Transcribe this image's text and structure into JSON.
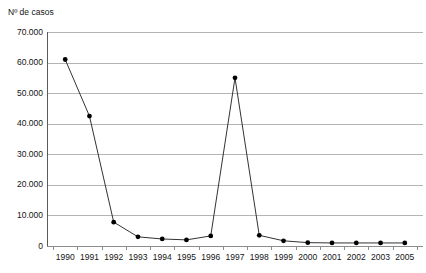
{
  "chart_data": {
    "type": "line",
    "title": "",
    "ylabel": "Nº de casos",
    "xlabel": "",
    "categories": [
      "1990",
      "1991",
      "1992",
      "1993",
      "1994",
      "1995",
      "1996",
      "1997",
      "1998",
      "1999",
      "2000",
      "2001",
      "2002",
      "2003",
      "2005"
    ],
    "values": [
      61000,
      42500,
      7800,
      3000,
      2300,
      2000,
      3300,
      55000,
      3500,
      1700,
      1100,
      1000,
      1000,
      1000,
      1000
    ],
    "ylim": [
      0,
      70000
    ],
    "ytick_labels": [
      "70.000",
      "60.000",
      "50.000",
      "40.000",
      "30.000",
      "20.000",
      "10.000",
      "0"
    ],
    "ytick_values": [
      70000,
      60000,
      50000,
      40000,
      30000,
      20000,
      10000,
      0
    ],
    "grid": true,
    "legend": "none",
    "series": [
      {
        "name": "Nº de casos",
        "marker": "filled-circle",
        "line_color": "#333333",
        "marker_color": "#000000",
        "values": [
          61000,
          42500,
          7800,
          3000,
          2300,
          2000,
          3300,
          55000,
          3500,
          1700,
          1100,
          1000,
          1000,
          1000,
          1000
        ]
      }
    ]
  },
  "colors": {
    "grid": "#b4b4b4",
    "axis": "#5a5a5a",
    "line": "#333333",
    "marker": "#000000",
    "background": "#ffffff",
    "text": "#141414"
  }
}
